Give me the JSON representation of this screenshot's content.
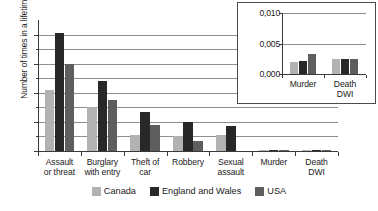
{
  "chart_data": {
    "type": "bar",
    "title": "",
    "xlabel": "",
    "ylabel": "Number of times in a lifetime",
    "ylim": [
      0,
      4.5
    ],
    "yticks": [
      "0",
      "1",
      "2",
      "3",
      "4"
    ],
    "grid": true,
    "legend_position": "bottom-center",
    "categories": [
      "Assault or threat",
      "Burglary with entry",
      "Theft of car",
      "Robbery",
      "Sexual assault",
      "Murder",
      "Death DWI"
    ],
    "category_lines": [
      [
        "Assault",
        "or threat"
      ],
      [
        "Burglary",
        "with entry"
      ],
      [
        "Theft of",
        "car"
      ],
      [
        "Robbery",
        ""
      ],
      [
        "Sexual",
        "assault"
      ],
      [
        "Murder",
        ""
      ],
      [
        "Death",
        "DWI"
      ]
    ],
    "series": [
      {
        "name": "Canada",
        "color": "#b2b2b2",
        "values": [
          2.1,
          1.5,
          0.55,
          0.5,
          0.55,
          0.002,
          0.0025
        ]
      },
      {
        "name": "England and Wales",
        "color": "#282828",
        "values": [
          4.05,
          2.4,
          1.35,
          1.0,
          0.85,
          0.002,
          0.0025
        ]
      },
      {
        "name": "USA",
        "color": "#5e5e5e",
        "values": [
          3.0,
          1.75,
          0.9,
          0.35,
          0.0,
          0.0033,
          0.0025
        ]
      }
    ]
  },
  "inset_chart_data": {
    "type": "bar",
    "title": "",
    "xlabel": "",
    "ylabel": "",
    "ylim": [
      0,
      0.01
    ],
    "yticks": [
      "0,000",
      "0,005",
      "0,010"
    ],
    "grid": true,
    "categories": [
      "Murder",
      "Death DWI"
    ],
    "category_lines": [
      [
        "Murder",
        ""
      ],
      [
        "Death",
        "DWI"
      ]
    ],
    "series": [
      {
        "name": "Canada",
        "color": "#b2b2b2",
        "values": [
          0.002,
          0.0025
        ]
      },
      {
        "name": "England and Wales",
        "color": "#282828",
        "values": [
          0.0021,
          0.0025
        ]
      },
      {
        "name": "USA",
        "color": "#5e5e5e",
        "values": [
          0.0033,
          0.0025
        ]
      }
    ]
  },
  "legend": {
    "items": [
      {
        "label": "Canada"
      },
      {
        "label": "England and Wales"
      },
      {
        "label": "USA"
      }
    ]
  }
}
